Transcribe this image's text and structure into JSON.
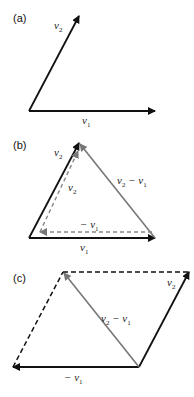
{
  "colors": {
    "black": "#111111",
    "gray": "#777777",
    "dashed_gray": "#888888"
  },
  "panels": [
    {
      "label": "(a)",
      "vectors": [
        {
          "name": "v1",
          "from": [
            29,
            111
          ],
          "to": [
            155,
            111
          ],
          "style": "solid",
          "color": "black"
        },
        {
          "name": "v2",
          "from": [
            29,
            111
          ],
          "to": [
            79,
            16
          ],
          "style": "solid",
          "color": "black"
        }
      ],
      "labels": {
        "v1": "v",
        "v1_sub": "1",
        "v2": "v",
        "v2_sub": "2"
      }
    },
    {
      "label": "(b)",
      "vectors": [
        {
          "name": "v1",
          "from": [
            29,
            238
          ],
          "to": [
            155,
            238
          ],
          "style": "solid",
          "color": "black"
        },
        {
          "name": "v2",
          "from": [
            29,
            238
          ],
          "to": [
            79,
            143
          ],
          "style": "solid",
          "color": "black"
        },
        {
          "name": "v2-v1",
          "from": [
            155,
            238
          ],
          "to": [
            79,
            143
          ],
          "style": "solid",
          "color": "gray"
        },
        {
          "name": "-v1",
          "from": [
            152,
            232
          ],
          "to": [
            40,
            232
          ],
          "style": "dashed",
          "color": "gray"
        },
        {
          "name": "v2 (translated)",
          "from": [
            40,
            232
          ],
          "to": [
            78,
            150
          ],
          "style": "dashed",
          "color": "gray"
        }
      ],
      "labels": {
        "v1": "v",
        "v1_sub": "1",
        "v2": "v",
        "v2_sub": "2",
        "v2_inner": "v",
        "v2_inner_sub": "2",
        "neg_v1": "− v",
        "neg_v1_sub": "1",
        "diff": "v",
        "diff_sub_a": "2",
        "diff_mid": " − v",
        "diff_sub_b": "1"
      }
    },
    {
      "label": "(c)",
      "vectors": [
        {
          "name": "-v1",
          "from": [
            139,
            367
          ],
          "to": [
            13,
            367
          ],
          "style": "solid",
          "color": "black"
        },
        {
          "name": "v2",
          "from": [
            139,
            367
          ],
          "to": [
            189,
            272
          ],
          "style": "solid",
          "color": "black"
        },
        {
          "name": "v2-v1",
          "from": [
            139,
            367
          ],
          "to": [
            63,
            272
          ],
          "style": "solid",
          "color": "gray"
        },
        {
          "name": "top-edge",
          "from": [
            63,
            272
          ],
          "to": [
            189,
            272
          ],
          "style": "dashed",
          "color": "black"
        },
        {
          "name": "left-edge",
          "from": [
            13,
            367
          ],
          "to": [
            63,
            272
          ],
          "style": "dashed",
          "color": "black"
        }
      ],
      "labels": {
        "v2": "v",
        "v2_sub": "2",
        "neg_v1": "− v",
        "neg_v1_sub": "1",
        "diff": "v",
        "diff_sub_a": "2",
        "diff_mid": " − v",
        "diff_sub_b": "1"
      }
    }
  ]
}
